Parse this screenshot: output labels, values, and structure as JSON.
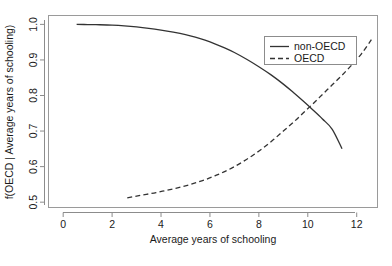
{
  "chart_data": {
    "type": "line",
    "title": "",
    "xlabel": "Average years of schooling",
    "ylabel": "f(OECD | Average years of schooling)",
    "xlim": [
      -0.6,
      12.85
    ],
    "ylim": [
      0.485,
      1.025
    ],
    "xticks": [
      0,
      2,
      4,
      6,
      8,
      10,
      12
    ],
    "xtick_labels": [
      "0",
      "2",
      "4",
      "6",
      "8",
      "10",
      "12"
    ],
    "yticks": [
      0.5,
      0.6,
      0.7,
      0.8,
      0.9,
      1.0
    ],
    "ytick_labels": [
      "0.5",
      "0.6",
      "0.7",
      "0.8",
      "0.9",
      "1.0"
    ],
    "grid": false,
    "legend_position": "top-right",
    "box": true,
    "series": [
      {
        "name": "non-OECD",
        "style": "solid",
        "color": "#333333",
        "x": [
          0.55,
          1.0,
          1.5,
          2.0,
          2.5,
          3.0,
          3.5,
          4.0,
          4.5,
          5.0,
          5.4,
          5.8,
          6.2,
          6.6,
          7.0,
          7.5,
          8.0,
          8.5,
          9.0,
          9.4,
          9.8,
          10.2,
          10.6,
          11.0,
          11.4
        ],
        "y": [
          1.0,
          0.9995,
          0.999,
          0.998,
          0.996,
          0.993,
          0.989,
          0.984,
          0.978,
          0.971,
          0.964,
          0.9555,
          0.9455,
          0.934,
          0.921,
          0.902,
          0.881,
          0.858,
          0.832,
          0.809,
          0.785,
          0.76,
          0.734,
          0.705,
          0.65
        ]
      },
      {
        "name": "OECD",
        "style": "dashed",
        "color": "#333333",
        "x": [
          2.62,
          3.0,
          3.4,
          3.8,
          4.2,
          4.6,
          5.0,
          5.4,
          5.8,
          6.2,
          6.6,
          7.0,
          7.4,
          7.8,
          8.2,
          8.6,
          9.0,
          9.4,
          9.8,
          10.2,
          10.6,
          11.0,
          11.4,
          11.8,
          12.2,
          12.6
        ],
        "y": [
          0.512,
          0.517,
          0.522,
          0.527,
          0.533,
          0.539,
          0.546,
          0.554,
          0.563,
          0.574,
          0.586,
          0.6,
          0.616,
          0.634,
          0.654,
          0.676,
          0.7,
          0.724,
          0.75,
          0.776,
          0.803,
          0.83,
          0.857,
          0.886,
          0.918,
          0.957
        ]
      }
    ],
    "legend_entries": [
      {
        "label": "non-OECD",
        "style": "solid"
      },
      {
        "label": "OECD",
        "style": "dashed"
      }
    ]
  },
  "caption": {
    "text": ""
  }
}
